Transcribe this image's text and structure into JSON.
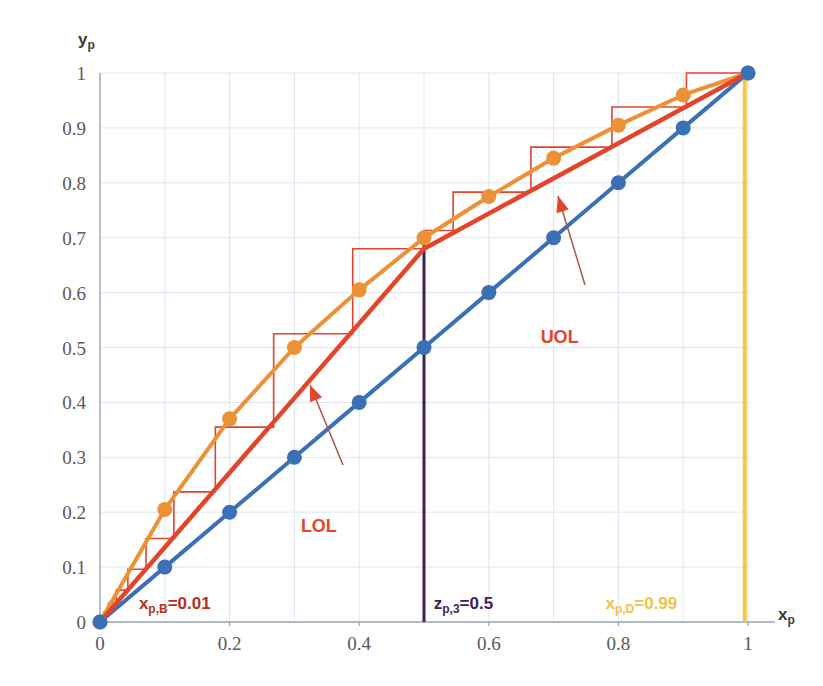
{
  "chart_data": {
    "type": "line",
    "title": "",
    "xlabel": "x_p",
    "ylabel": "y_p",
    "xlim": [
      0,
      1
    ],
    "ylim": [
      0,
      1
    ],
    "grid": true,
    "legend_position": "inline-annotations",
    "x_ticks": [
      "0",
      "0.2",
      "0.4",
      "0.6",
      "0.8",
      "1"
    ],
    "x_tick_values": [
      0,
      0.2,
      0.4,
      0.6,
      0.8,
      1
    ],
    "y_ticks": [
      "0",
      "0.1",
      "0.2",
      "0.3",
      "0.4",
      "0.5",
      "0.6",
      "0.7",
      "0.8",
      "0.9",
      "1"
    ],
    "y_tick_values": [
      0,
      0.1,
      0.2,
      0.3,
      0.4,
      0.5,
      0.6,
      0.7,
      0.8,
      0.9,
      1
    ],
    "series": [
      {
        "name": "equilibrium-curve",
        "color": "#ED9136",
        "marker": "circle",
        "x": [
          0,
          0.1,
          0.2,
          0.3,
          0.4,
          0.5,
          0.6,
          0.7,
          0.8,
          0.9,
          1
        ],
        "values": [
          0,
          0.205,
          0.37,
          0.5,
          0.605,
          0.7,
          0.775,
          0.845,
          0.905,
          0.96,
          1
        ]
      },
      {
        "name": "diagonal-45-line",
        "color": "#3B6FB6",
        "marker": "circle",
        "x": [
          0,
          0.1,
          0.2,
          0.3,
          0.4,
          0.5,
          0.6,
          0.7,
          0.8,
          0.9,
          1
        ],
        "values": [
          0,
          0.1,
          0.2,
          0.3,
          0.4,
          0.5,
          0.6,
          0.7,
          0.8,
          0.9,
          1
        ]
      },
      {
        "name": "LOL",
        "label": "LOL",
        "color": "#E2452A",
        "description": "lower operating line from (0.01,0.01) to (0.5,0.68)",
        "x": [
          0.0,
          0.5
        ],
        "values": [
          0.0,
          0.68
        ]
      },
      {
        "name": "UOL",
        "label": "UOL",
        "color": "#E2452A",
        "description": "upper operating line from (0.5,0.68) to (0.99,1)",
        "x": [
          0.5,
          1.0
        ],
        "values": [
          0.68,
          1.0
        ]
      }
    ],
    "annotations": [
      {
        "name": "xpB",
        "text": "x",
        "sub": "p,B",
        "rest": "=0.01",
        "color": "#B5301B",
        "x": 0.06,
        "y": 0.035
      },
      {
        "name": "zp3",
        "text": "z",
        "sub": "p,3",
        "rest": "=0.5",
        "color": "#3D2352",
        "x": 0.515,
        "y": 0.035
      },
      {
        "name": "xpD",
        "text": "x",
        "sub": "p,D",
        "rest": "=0.99",
        "color": "#F2C14B",
        "x": 0.78,
        "y": 0.035
      },
      {
        "name": "UOL",
        "text": "UOL",
        "color": "#E2452A",
        "x": 0.68,
        "y": 0.52
      },
      {
        "name": "LOL",
        "text": "LOL",
        "color": "#E2452A",
        "x": 0.31,
        "y": 0.175
      }
    ],
    "vertical_lines": [
      {
        "name": "feed-line-zp3",
        "x": 0.5,
        "y_from": 0,
        "y_to": 0.7,
        "color": "#3D2352"
      },
      {
        "name": "distillate-line-xpD",
        "x": 0.995,
        "y_from": 0,
        "y_to": 1.0,
        "color": "#F6C745"
      }
    ],
    "stage_steps": {
      "name": "mccabe-thiele-stages",
      "color": "#E2452A",
      "description": "staircase construction between equilibrium curve and operating lines",
      "points": [
        [
          1.0,
          1.0
        ],
        [
          0.905,
          1.0
        ],
        [
          0.905,
          0.938
        ],
        [
          0.79,
          0.938
        ],
        [
          0.79,
          0.865
        ],
        [
          0.665,
          0.865
        ],
        [
          0.665,
          0.783
        ],
        [
          0.545,
          0.783
        ],
        [
          0.545,
          0.713
        ],
        [
          0.5,
          0.713
        ],
        [
          0.5,
          0.68
        ],
        [
          0.39,
          0.68
        ],
        [
          0.39,
          0.525
        ],
        [
          0.268,
          0.525
        ],
        [
          0.268,
          0.355
        ],
        [
          0.178,
          0.355
        ],
        [
          0.178,
          0.237
        ],
        [
          0.114,
          0.237
        ],
        [
          0.114,
          0.152
        ],
        [
          0.071,
          0.152
        ],
        [
          0.071,
          0.096
        ],
        [
          0.043,
          0.096
        ],
        [
          0.043,
          0.058
        ],
        [
          0.025,
          0.058
        ],
        [
          0.025,
          0.034
        ],
        [
          0.013,
          0.034
        ],
        [
          0.013,
          0.018
        ],
        [
          0.006,
          0.018
        ],
        [
          0.006,
          0.008
        ],
        [
          0.0,
          0.008
        ],
        [
          0.0,
          0.0
        ]
      ]
    }
  },
  "axis": {
    "y_title_main": "y",
    "y_title_sub": "p",
    "x_title_main": "x",
    "x_title_sub": "p"
  },
  "colors": {
    "equilibrium": "#ED9136",
    "diagonal": "#3B6FB6",
    "operating": "#E2452A",
    "feed_line": "#3D2352",
    "distillate_line": "#F6C745",
    "grid": "#DCE6F1",
    "axis": "#9BA7B4",
    "background": "#FFFFFF"
  }
}
